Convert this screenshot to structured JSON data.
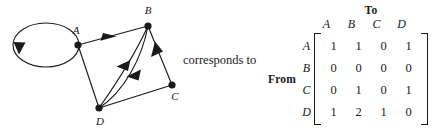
{
  "connector": {
    "text": "corresponds to"
  },
  "graph": {
    "nodes": [
      {
        "id": "A",
        "label": "A",
        "x": 78,
        "y": 45,
        "label_x": 76,
        "label_y": 34
      },
      {
        "id": "B",
        "label": "B",
        "x": 148,
        "y": 26,
        "label_x": 148,
        "label_y": 14
      },
      {
        "id": "C",
        "label": "C",
        "x": 172,
        "y": 85,
        "label_x": 174,
        "label_y": 100
      },
      {
        "id": "D",
        "label": "D",
        "x": 99,
        "y": 108,
        "label_x": 100,
        "label_y": 125
      }
    ],
    "self_loop": {
      "node": "A",
      "label": "self-loop-at-a"
    },
    "edges": [
      {
        "from": "A",
        "to": "A",
        "type": "loop",
        "name": "edge-a-to-a"
      },
      {
        "from": "A",
        "to": "B",
        "type": "straight",
        "name": "edge-a-to-b"
      },
      {
        "from": "A",
        "to": "D",
        "type": "straight",
        "name": "edge-a-to-d"
      },
      {
        "from": "C",
        "to": "B",
        "type": "straight",
        "name": "edge-c-to-b"
      },
      {
        "from": "D",
        "to": "B",
        "type": "curved",
        "name": "edge-d-to-b-1"
      },
      {
        "from": "D",
        "to": "B",
        "type": "curved",
        "name": "edge-d-to-b-2"
      },
      {
        "from": "D",
        "to": "C",
        "type": "straight",
        "name": "edge-d-to-c"
      }
    ]
  },
  "matrix": {
    "to_label": "To",
    "from_label": "From",
    "column_headers": [
      "A",
      "B",
      "C",
      "D"
    ],
    "row_headers": [
      "A",
      "B",
      "C",
      "D"
    ],
    "rows": [
      [
        "1",
        "1",
        "0",
        "1"
      ],
      [
        "0",
        "0",
        "0",
        "0"
      ],
      [
        "0",
        "1",
        "0",
        "1"
      ],
      [
        "1",
        "2",
        "1",
        "0"
      ]
    ]
  },
  "style": {
    "ink": "#1a1a1a",
    "background": "#ffffff"
  }
}
